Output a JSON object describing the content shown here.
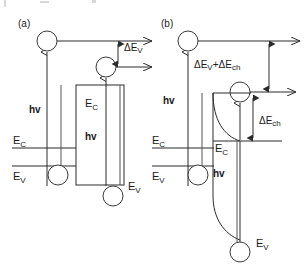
{
  "figure": {
    "type": "band-diagram",
    "width": 308,
    "height": 279,
    "background": "#ffffff",
    "line_color": "#2b2b2b",
    "text_color": "#1a1a1a"
  },
  "panels": [
    {
      "id": "a",
      "label": "(a)",
      "description": "Type-I / square quantum well band alignment with photon absorption and carrier escape",
      "labels": {
        "conduction_band_barrier": "E",
        "conduction_band_barrier_sub": "C",
        "valence_band_barrier": "E",
        "valence_band_barrier_sub": "V",
        "conduction_band_well": "E",
        "conduction_band_well_sub": "C",
        "valence_band_well": "E",
        "valence_band_well_sub": "V",
        "photon_left": "hv",
        "photon_well": "hv",
        "offset_symbol": "ΔE",
        "offset_sub": "V"
      }
    },
    {
      "id": "b",
      "label": "(b)",
      "description": "Graded / triangular well band alignment with additional charge-induced offset",
      "labels": {
        "conduction_band_barrier": "E",
        "conduction_band_barrier_sub": "C",
        "valence_band_barrier": "E",
        "valence_band_barrier_sub": "V",
        "conduction_band_well": "E",
        "conduction_band_well_sub": "C",
        "valence_band_well": "E",
        "valence_band_well_sub": "V",
        "photon_left": "hv",
        "photon_well": "hv",
        "offset_total_prefix": "ΔE",
        "offset_total_sub1": "V",
        "offset_total_plus": "+ΔE",
        "offset_total_sub2": "ch",
        "offset_ch_symbol": "ΔE",
        "offset_ch_sub": "ch"
      }
    }
  ],
  "legend_note": "Electron and hole states shown as open circles; vertical arrows indicate optical transitions and carrier escape."
}
